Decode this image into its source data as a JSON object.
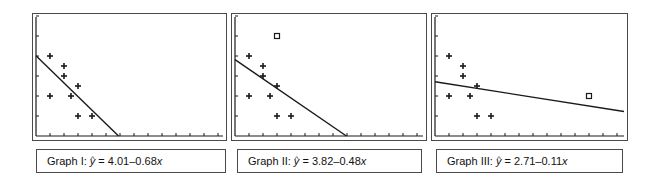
{
  "chart_data": [
    {
      "type": "scatter",
      "title": "Graph I",
      "equation_label": "Graph I:",
      "equation": "ŷ = 4.01–0.68x",
      "intercept": 4.01,
      "slope": -0.68,
      "xlim": [
        0,
        13
      ],
      "ylim": [
        0,
        6
      ],
      "x_ticks": [
        1,
        2,
        3,
        4,
        5,
        6,
        7,
        8,
        9,
        10,
        11,
        12,
        13
      ],
      "y_ticks": [
        1,
        2,
        3,
        4,
        5,
        6
      ],
      "grid": false,
      "points": [
        {
          "x": 1,
          "y": 4
        },
        {
          "x": 2,
          "y": 3.5
        },
        {
          "x": 2,
          "y": 3
        },
        {
          "x": 3,
          "y": 2.5
        },
        {
          "x": 1,
          "y": 2
        },
        {
          "x": 2.5,
          "y": 2
        },
        {
          "x": 3,
          "y": 1
        },
        {
          "x": 4,
          "y": 1
        }
      ],
      "outliers": []
    },
    {
      "type": "scatter",
      "title": "Graph II",
      "equation_label": "Graph II:",
      "equation": "ŷ = 3.82–0.48x",
      "intercept": 3.82,
      "slope": -0.48,
      "xlim": [
        0,
        13
      ],
      "ylim": [
        0,
        6
      ],
      "x_ticks": [
        1,
        2,
        3,
        4,
        5,
        6,
        7,
        8,
        9,
        10,
        11,
        12,
        13
      ],
      "y_ticks": [
        1,
        2,
        3,
        4,
        5,
        6
      ],
      "grid": false,
      "points": [
        {
          "x": 1,
          "y": 4
        },
        {
          "x": 2,
          "y": 3.5
        },
        {
          "x": 2,
          "y": 3
        },
        {
          "x": 3,
          "y": 2.5
        },
        {
          "x": 1,
          "y": 2
        },
        {
          "x": 2.5,
          "y": 2
        },
        {
          "x": 3,
          "y": 1
        },
        {
          "x": 4,
          "y": 1
        }
      ],
      "outliers": [
        {
          "x": 3,
          "y": 5
        }
      ]
    },
    {
      "type": "scatter",
      "title": "Graph III",
      "equation_label": "Graph III:",
      "equation": "ŷ = 2.71–0.11x",
      "intercept": 2.71,
      "slope": -0.11,
      "xlim": [
        0,
        13
      ],
      "ylim": [
        0,
        6
      ],
      "x_ticks": [
        1,
        2,
        3,
        4,
        5,
        6,
        7,
        8,
        9,
        10,
        11,
        12,
        13
      ],
      "y_ticks": [
        1,
        2,
        3,
        4,
        5,
        6
      ],
      "grid": false,
      "points": [
        {
          "x": 1,
          "y": 4
        },
        {
          "x": 2,
          "y": 3.5
        },
        {
          "x": 2,
          "y": 3
        },
        {
          "x": 3,
          "y": 2.5
        },
        {
          "x": 1,
          "y": 2
        },
        {
          "x": 2.5,
          "y": 2
        },
        {
          "x": 3,
          "y": 1
        },
        {
          "x": 4,
          "y": 1
        }
      ],
      "outliers": [
        {
          "x": 11,
          "y": 2
        }
      ]
    }
  ],
  "panels": [
    {
      "label_prefix": "Graph I: ",
      "yhat": "y",
      "eq_rest": " = 4.01–0.68",
      "xvar": "x"
    },
    {
      "label_prefix": "Graph II: ",
      "yhat": "y",
      "eq_rest": " = 3.82–0.48",
      "xvar": "x"
    },
    {
      "label_prefix": "Graph III: ",
      "yhat": "y",
      "eq_rest": " = 2.71–0.11",
      "xvar": "x"
    }
  ],
  "colors": {
    "ink": "#1a1a1a",
    "frame": "#4a4a4a",
    "background": "#ffffff"
  }
}
